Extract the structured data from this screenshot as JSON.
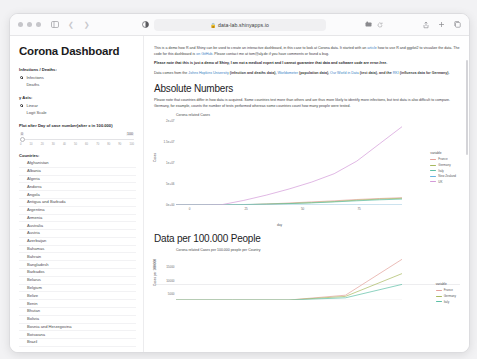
{
  "browser": {
    "url": "data-lab.shinyapps.io",
    "lock_icon": "lock-icon",
    "sidebar_icon": "sidebar-toggle-icon",
    "back_icon": "back-chevron-icon",
    "forward_icon": "forward-chevron-icon",
    "reader_icon": "reader-mode-icon",
    "page_settings_icon": "page-settings-icon",
    "extension_icon": "extension-icon",
    "reload_icon": "reload-icon",
    "share_icon": "share-icon",
    "new_tab_icon": "new-tab-icon",
    "tabs_icon": "tab-overview-icon"
  },
  "sidebar": {
    "app_title": "Corona Dashboard",
    "groups": [
      {
        "label": "Infections / Deaths:",
        "options": [
          {
            "label": "Infections",
            "selected": true
          },
          {
            "label": "Deaths",
            "selected": false
          }
        ]
      },
      {
        "label": "y Axis:",
        "options": [
          {
            "label": "Linear",
            "selected": true
          },
          {
            "label": "Logit Scale",
            "selected": false
          }
        ]
      }
    ],
    "slider": {
      "label": "Plot after Day of case number(after x in 100.000)",
      "min_value": "0",
      "max_value": "100",
      "ticks": [
        "0",
        "10",
        "20",
        "30",
        "40",
        "50",
        "60",
        "70",
        "80",
        "90",
        "100"
      ]
    },
    "countries_label": "Countries:",
    "countries": [
      "Afghanistan",
      "Albania",
      "Algeria",
      "Andorra",
      "Angola",
      "Antigua and Barbuda",
      "Argentina",
      "Armenia",
      "Australia",
      "Austria",
      "Azerbaijan",
      "Bahamas",
      "Bahrain",
      "Bangladesh",
      "Barbados",
      "Belarus",
      "Belgium",
      "Belize",
      "Benin",
      "Bhutan",
      "Bolivia",
      "Bosnia and Herzegovina",
      "Botswana",
      "Brazil"
    ]
  },
  "main": {
    "intro_part1": "This is a demo how R and Shiny can be used to create an interactive dashboard, in this case to look at Corona data. It started with an ",
    "intro_link1": "article",
    "intro_part2": " how to use R and ggplot2 to visualize the data. The code for this dashboard is ",
    "intro_link2": "on GitHub",
    "intro_part3": ". Please contact me at tom@aly.de if you have comments or found a bug.",
    "disclaimer": "Please note that this is just a demo of Shiny, I am not a medical expert and I cannot guarantee that data and software code are error-free.",
    "source_part1": "Data comes from the ",
    "source_link1": "Johns Hopkins University",
    "source_part2": " (infection and deaths data), ",
    "source_link2": "Worldometer",
    "source_part3": " (population data), ",
    "source_link3": "Our World in Data",
    "source_part4": " (test data), and the ",
    "source_link4": "RKI",
    "source_part5": " (influenza data for Germany).",
    "section1_title": "Absolute Numbers",
    "section1_para": "Please note that countries differ in how data is acquired. Some countries test more than others and are thus more likely to identify more infections, but test data is also difficult to compare. Germany, for example, counts the number of tests performed whereas some countries count how many people were tested.",
    "section2_title": "Data per 100.000 People"
  },
  "chart_data": [
    {
      "type": "line",
      "title": "Corona related Cases",
      "xlabel": "day",
      "ylabel": "Cases",
      "x": [
        0,
        10,
        20,
        30,
        40,
        50,
        60,
        70,
        80,
        90,
        100
      ],
      "xticks": [
        "0",
        "25",
        "50",
        "75"
      ],
      "yticks": [
        "0e+00",
        "5e+06",
        "1e+07",
        "1.5e+07",
        "2e+07"
      ],
      "ylim": [
        0,
        22000000
      ],
      "legend_title": "variable",
      "legend_position": "right",
      "grid": false,
      "series": [
        {
          "name": "France",
          "color": "#e3a09a",
          "values": [
            0,
            0,
            10000,
            90000,
            260000,
            520000,
            800000,
            1100000,
            1450000,
            1700000,
            1900000
          ]
        },
        {
          "name": "Germany",
          "color": "#a8b95e",
          "values": [
            0,
            0,
            8000,
            70000,
            200000,
            400000,
            620000,
            900000,
            1250000,
            1550000,
            1750000
          ]
        },
        {
          "name": "Italy",
          "color": "#5bbfa5",
          "values": [
            0,
            2000,
            30000,
            120000,
            230000,
            360000,
            540000,
            800000,
            1100000,
            1350000,
            1550000
          ]
        },
        {
          "name": "New Zealand",
          "color": "#66b4e0",
          "values": [
            0,
            0,
            200,
            800,
            1500,
            1800,
            2000,
            2100,
            2200,
            2300,
            2400
          ]
        },
        {
          "name": "UK",
          "color": "#d39ad8",
          "values": [
            0,
            0,
            60000,
            1200000,
            2600000,
            4200000,
            6000000,
            8200000,
            11500000,
            16000000,
            20500000
          ]
        }
      ]
    },
    {
      "type": "line",
      "title": "Corona related Cases per 100.000 people per Country",
      "xlabel": "day",
      "ylabel": "Cases per 100.000",
      "x": [
        0,
        25,
        50,
        75,
        100
      ],
      "yticks": [
        "15000",
        "10000",
        "5000"
      ],
      "legend_title": "variable",
      "legend_position": "right",
      "grid": false,
      "series": [
        {
          "name": "France",
          "color": "#e3a09a",
          "values": [
            0,
            0,
            0,
            2000,
            17000
          ]
        },
        {
          "name": "Germany",
          "color": "#a8b95e",
          "values": [
            0,
            0,
            0,
            1500,
            11000
          ]
        },
        {
          "name": "Italy",
          "color": "#5bbfa5",
          "values": [
            0,
            0,
            0,
            900,
            6500
          ]
        }
      ]
    }
  ]
}
